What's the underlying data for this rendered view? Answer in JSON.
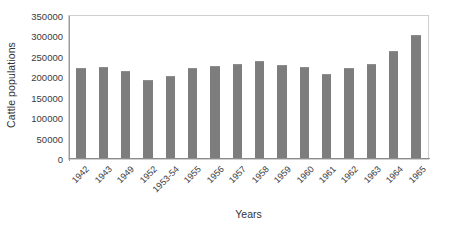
{
  "chart_data": {
    "type": "bar",
    "title": "",
    "xlabel": "Years",
    "ylabel": "Cattle populations",
    "categories": [
      "1942",
      "1943",
      "1949",
      "1952",
      "1953-54",
      "1955",
      "1956",
      "1957",
      "1958",
      "1959",
      "1960",
      "1961",
      "1962",
      "1963",
      "1964",
      "1965"
    ],
    "values": [
      220000,
      222000,
      213000,
      191000,
      201000,
      220000,
      225000,
      230000,
      237000,
      227000,
      222000,
      205000,
      220000,
      230000,
      262000,
      301000
    ],
    "ylim": [
      0,
      350000
    ],
    "ytick_labels": [
      "0",
      "50000",
      "100000",
      "150000",
      "200000",
      "250000",
      "300000",
      "350000"
    ],
    "ytick_values": [
      0,
      50000,
      100000,
      150000,
      200000,
      250000,
      300000,
      350000
    ],
    "grid": false,
    "legend": false,
    "bar_color": "#7d7d7d",
    "plot_border_color": "#d0d0d0",
    "axis_color": "#8c8c8c",
    "xtick_rotation": -45
  }
}
